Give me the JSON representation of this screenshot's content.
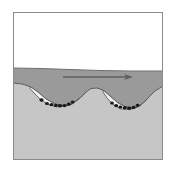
{
  "figure": {
    "domain_label": "Diagram",
    "type": "geological-cross-section",
    "title": "",
    "caption": ""
  },
  "frame": {
    "name": "figure-border",
    "stroke_color": "#8a8a8a",
    "stroke_width": 1,
    "fill_color": "#ffffff",
    "x": 13,
    "y": 12,
    "width": 150,
    "height": 148
  },
  "layers": [
    {
      "id": "air",
      "label": "air",
      "fill_color": "#ffffff",
      "order": 0
    },
    {
      "id": "water",
      "label": "water",
      "fill_color": "#9a9a9a",
      "stroke_color": "#6f6f6f",
      "order": 1
    },
    {
      "id": "bed",
      "label": "sediment bed",
      "fill_color": "#c6c6c6",
      "stroke_color": "#6f6f6f",
      "order": 2
    },
    {
      "id": "scour-fill",
      "label": "scour fill",
      "fill_color": "#f2f0ee",
      "stroke_color": "#5a5a5a",
      "order": 3
    }
  ],
  "surfaces": {
    "water_surface": {
      "name": "water-surface-line",
      "stroke_color": "#6f6f6f",
      "points": "13,68 40,68.5 70,69.5 100,70.5 130,71 163,71"
    },
    "bed_surface": {
      "name": "bed-surface-line",
      "stroke_color": "#5a5a5a",
      "points": "13,83 22,84 30,86.5 38,92 46,99 55,104 64,106 72,104 80,98 86,92 91,88.5 97,88 103,90 110,96 118,103 126,107 134,108 141,105 148,98 155,91 163,86"
    }
  },
  "arrow": {
    "name": "flow-direction-arrow",
    "label": "flow direction",
    "color": "#5e5e5e",
    "x1": 63,
    "y1": 77,
    "x2": 133,
    "y2": 77,
    "head_length": 9,
    "head_width": 6,
    "line_width": 1.6
  },
  "scours": [
    {
      "id": "scour-left",
      "label": "left scour hollow",
      "fill_color": "#f2f0ee",
      "stroke_color": "#5a5a5a",
      "outline": "30,86.5 38,92 46,99 55,104 64,106 72,104 80,98 86,92 83,95.5 76,101 67,105.5 57,107 48,104.5 40,99 34,93 30,88.5",
      "pebbles": [
        {
          "cx": 41.5,
          "cy": 100.0,
          "rx": 2.1,
          "ry": 1.7
        },
        {
          "cx": 47.0,
          "cy": 103.5,
          "rx": 2.0,
          "ry": 1.6
        },
        {
          "cx": 51.5,
          "cy": 104.6,
          "rx": 2.0,
          "ry": 1.6
        },
        {
          "cx": 55.8,
          "cy": 105.4,
          "rx": 2.0,
          "ry": 1.6
        },
        {
          "cx": 60.0,
          "cy": 105.8,
          "rx": 2.2,
          "ry": 1.8
        },
        {
          "cx": 64.5,
          "cy": 105.6,
          "rx": 2.1,
          "ry": 1.7
        },
        {
          "cx": 68.8,
          "cy": 104.2,
          "rx": 2.0,
          "ry": 1.6
        },
        {
          "cx": 72.6,
          "cy": 102.0,
          "rx": 1.9,
          "ry": 1.5
        }
      ],
      "pebble_color": "#1a1a1a"
    },
    {
      "id": "scour-right",
      "label": "right scour hollow",
      "fill_color": "#f2f0ee",
      "stroke_color": "#5a5a5a",
      "outline": "103,90 110,96 118,103 126,107 134,108 141,105 148,98 145,101.5 138,107 130,109.5 121,109 113,104.5 107,98 103,92",
      "pebbles": [
        {
          "cx": 112.0,
          "cy": 103.0,
          "rx": 1.9,
          "ry": 1.5
        },
        {
          "cx": 116.2,
          "cy": 105.6,
          "rx": 2.0,
          "ry": 1.6
        },
        {
          "cx": 120.4,
          "cy": 107.0,
          "rx": 2.0,
          "ry": 1.6
        },
        {
          "cx": 124.8,
          "cy": 107.8,
          "rx": 2.1,
          "ry": 1.7
        },
        {
          "cx": 129.2,
          "cy": 108.2,
          "rx": 2.1,
          "ry": 1.7
        },
        {
          "cx": 133.5,
          "cy": 107.4,
          "rx": 2.0,
          "ry": 1.6
        },
        {
          "cx": 137.6,
          "cy": 105.2,
          "rx": 1.9,
          "ry": 1.5
        }
      ],
      "pebble_color": "#1a1a1a"
    }
  ]
}
